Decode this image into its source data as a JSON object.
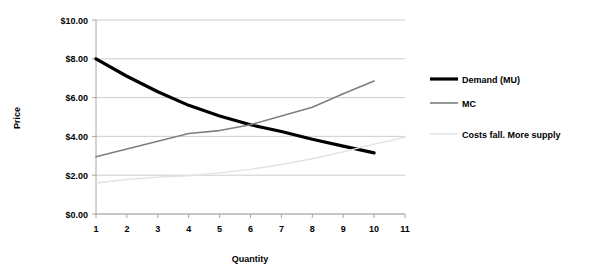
{
  "chart_data": {
    "type": "line",
    "title": "",
    "xlabel": "Quantity",
    "ylabel": "Price",
    "x": [
      1,
      2,
      3,
      4,
      5,
      6,
      7,
      8,
      9,
      10,
      11
    ],
    "xticklabels": [
      "1",
      "2",
      "3",
      "4",
      "5",
      "6",
      "7",
      "8",
      "9",
      "10",
      "11"
    ],
    "xlim": [
      1,
      11
    ],
    "ylim": [
      0,
      10
    ],
    "yticks": [
      0,
      2,
      4,
      6,
      8,
      10
    ],
    "yticklabels": [
      "$0.00",
      "$2.00",
      "$4.00",
      "$6.00",
      "$8.00",
      "$10.00"
    ],
    "grid": "horizontal",
    "legend_position": "right",
    "series": [
      {
        "name": "Demand (MU)",
        "color": "#000000",
        "width": 3.2,
        "x": [
          1,
          2,
          3,
          4,
          5,
          6,
          7,
          8,
          9,
          10
        ],
        "values": [
          8.0,
          7.1,
          6.3,
          5.6,
          5.05,
          4.6,
          4.25,
          3.85,
          3.5,
          3.15
        ]
      },
      {
        "name": "MC",
        "color": "#7f7f7f",
        "width": 1.6,
        "x": [
          1,
          2,
          3,
          4,
          5,
          6,
          7,
          8,
          9,
          10
        ],
        "values": [
          2.95,
          3.35,
          3.75,
          4.15,
          4.3,
          4.6,
          5.05,
          5.5,
          6.2,
          6.85
        ]
      },
      {
        "name": "Costs fall. More supply",
        "color": "#e2e2e2",
        "width": 1.4,
        "x": [
          1,
          2,
          3,
          4,
          5,
          6,
          7,
          8,
          9,
          10,
          11
        ],
        "values": [
          1.6,
          1.78,
          1.9,
          1.97,
          2.12,
          2.3,
          2.55,
          2.85,
          3.2,
          3.6,
          3.95
        ]
      }
    ]
  },
  "legend": {
    "items": [
      {
        "label": "Demand (MU)"
      },
      {
        "label": "MC"
      },
      {
        "label": "Costs fall. More supply"
      }
    ]
  },
  "colors": {
    "demand": "#000000",
    "mc": "#7f7f7f",
    "costs": "#e2e2e2",
    "gridline": "#c8c8c8",
    "axis": "#a6a6a6",
    "background": "#ffffff"
  }
}
